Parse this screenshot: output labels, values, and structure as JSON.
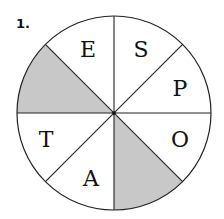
{
  "problem_number": "1.",
  "wheel": {
    "center": [
      114,
      113
    ],
    "radius": 97,
    "segment_count": 8,
    "shade_color": "#c8c8c8",
    "line_color": "#222222",
    "segments": [
      {
        "position": "top-left",
        "letter": "E",
        "shaded": false,
        "label_xy": [
          88,
          49
        ]
      },
      {
        "position": "top-right",
        "letter": "S",
        "shaded": false,
        "label_xy": [
          141,
          49
        ]
      },
      {
        "position": "right-upper",
        "letter": "P",
        "shaded": false,
        "label_xy": [
          180,
          88
        ]
      },
      {
        "position": "right-lower",
        "letter": "O",
        "shaded": false,
        "label_xy": [
          180,
          139
        ]
      },
      {
        "position": "bottom-right",
        "letter": "",
        "shaded": true
      },
      {
        "position": "bottom-left",
        "letter": "A",
        "shaded": false,
        "label_xy": [
          91,
          178
        ]
      },
      {
        "position": "left-lower",
        "letter": "T",
        "shaded": false,
        "label_xy": [
          46,
          139
        ]
      },
      {
        "position": "left-upper",
        "letter": "",
        "shaded": true
      }
    ]
  }
}
